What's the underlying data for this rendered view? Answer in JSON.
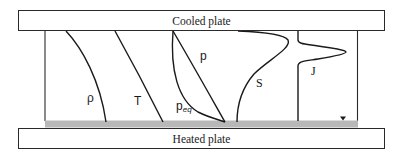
{
  "diagram": {
    "top_plate": {
      "label": "Cooled plate"
    },
    "bottom_plate": {
      "label": "Heated plate"
    },
    "heated_layer_color": "#b8b8b8",
    "line_color": "#1a1a1a",
    "curves": [
      {
        "id": "rho",
        "label": "ρ",
        "description": "density profile"
      },
      {
        "id": "T",
        "label": "T",
        "description": "temperature profile"
      },
      {
        "id": "p",
        "label": "p",
        "description": "pressure profile"
      },
      {
        "id": "p_eq",
        "label": "p",
        "label_sub": "eq",
        "description": "equilibrium pressure profile"
      },
      {
        "id": "S",
        "label": "S",
        "description": "supersaturation profile"
      },
      {
        "id": "J",
        "label": "J",
        "description": "nucleation rate profile"
      }
    ],
    "marker": {
      "symbol": "▼"
    }
  }
}
